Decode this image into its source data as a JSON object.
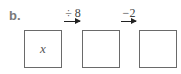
{
  "label": "b.",
  "boxes": [
    {
      "content": "x"
    },
    {
      "content": ""
    },
    {
      "content": ""
    }
  ],
  "operations": [
    {
      "label": "÷ 8"
    },
    {
      "label": "−2"
    }
  ],
  "colors": {
    "box_border": "#6a6a6a",
    "arrow": "#222222"
  }
}
